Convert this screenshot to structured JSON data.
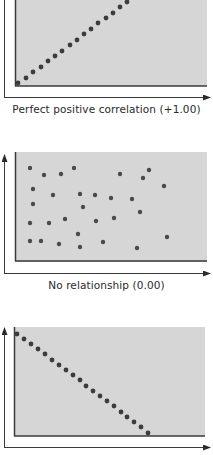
{
  "colors": {
    "panel_fill": "#d6d6d6",
    "axis": "#3a3a3a",
    "dot": "#3c3c3c",
    "caption": "#2a2a2a"
  },
  "panels": [
    {
      "caption": "Perfect positive correlation (+1.00)",
      "relationship": "positive",
      "coefficient": "+1.00"
    },
    {
      "caption": "No relationship (0.00)",
      "relationship": "none",
      "coefficient": "0.00"
    },
    {
      "caption": "",
      "relationship": "negative",
      "coefficient": ""
    }
  ],
  "chart_data": [
    {
      "type": "scatter",
      "title": "Perfect positive correlation (+1.00)",
      "xlabel": "",
      "ylabel": "",
      "grid": false,
      "points_px": [
        [
          18,
          83
        ],
        [
          26,
          78
        ],
        [
          33,
          72
        ],
        [
          41,
          67
        ],
        [
          48,
          61
        ],
        [
          55,
          56
        ],
        [
          62,
          51
        ],
        [
          70,
          45
        ],
        [
          77,
          40
        ],
        [
          84,
          34
        ],
        [
          91,
          29
        ],
        [
          98,
          23
        ],
        [
          106,
          18
        ],
        [
          113,
          13
        ],
        [
          120,
          7
        ],
        [
          127,
          2
        ],
        [
          134,
          -3
        ]
      ]
    },
    {
      "type": "scatter",
      "title": "No relationship (0.00)",
      "xlabel": "",
      "ylabel": "",
      "grid": false,
      "points_px": [
        [
          30,
          168
        ],
        [
          44,
          175
        ],
        [
          61,
          174
        ],
        [
          74,
          168
        ],
        [
          120,
          174
        ],
        [
          143,
          178
        ],
        [
          149,
          170
        ],
        [
          164,
          186
        ],
        [
          33,
          189
        ],
        [
          53,
          195
        ],
        [
          80,
          194
        ],
        [
          95,
          195
        ],
        [
          111,
          198
        ],
        [
          132,
          199
        ],
        [
          33,
          204
        ],
        [
          83,
          207
        ],
        [
          140,
          212
        ],
        [
          30,
          223
        ],
        [
          49,
          223
        ],
        [
          65,
          219
        ],
        [
          96,
          221
        ],
        [
          114,
          218
        ],
        [
          78,
          234
        ],
        [
          30,
          241
        ],
        [
          41,
          241
        ],
        [
          59,
          244
        ],
        [
          80,
          247
        ],
        [
          103,
          242
        ],
        [
          137,
          248
        ],
        [
          167,
          237
        ]
      ]
    },
    {
      "type": "scatter",
      "title": "",
      "xlabel": "",
      "ylabel": "",
      "grid": false,
      "points_px": [
        [
          17,
          334
        ],
        [
          24,
          339
        ],
        [
          31,
          344
        ],
        [
          38,
          349
        ],
        [
          45,
          354
        ],
        [
          52,
          360
        ],
        [
          59,
          365
        ],
        [
          66,
          370
        ],
        [
          73,
          375
        ],
        [
          80,
          380
        ],
        [
          86,
          386
        ],
        [
          93,
          391
        ],
        [
          100,
          396
        ],
        [
          107,
          401
        ],
        [
          114,
          406
        ],
        [
          121,
          412
        ],
        [
          127,
          417
        ],
        [
          134,
          422
        ],
        [
          141,
          427
        ],
        [
          148,
          433
        ]
      ]
    }
  ]
}
